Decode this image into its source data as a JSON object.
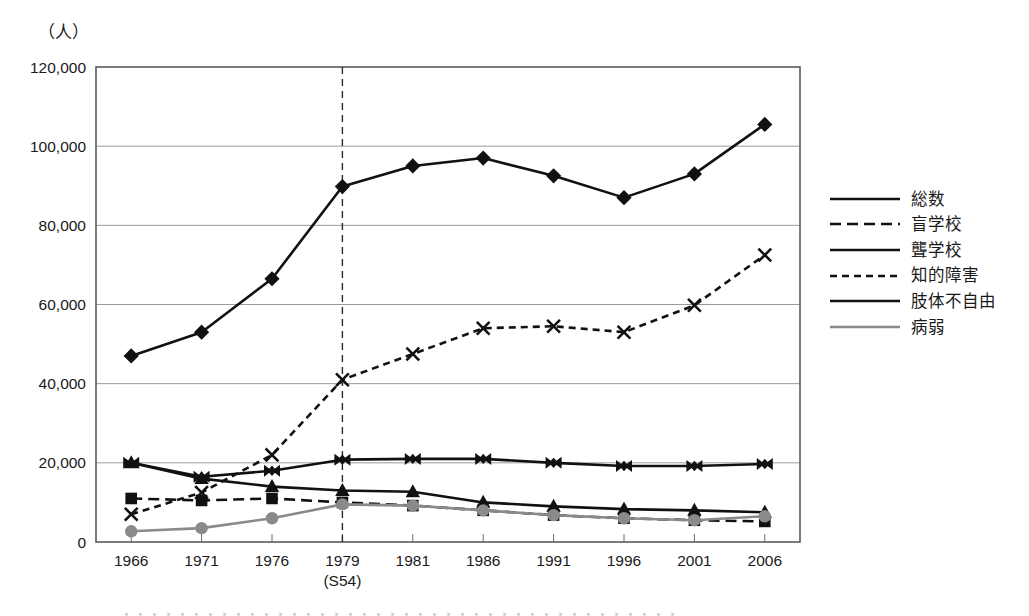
{
  "axis": {
    "unit_label": "（人）",
    "y_ticks": [
      "0",
      "20,000",
      "40,000",
      "60,000",
      "80,000",
      "100,000",
      "120,000"
    ],
    "x_sub_label": "(S54)"
  },
  "legend": {
    "items": [
      {
        "label": "総数",
        "marker": "diamond-marker",
        "line": "solid",
        "color": "#111111"
      },
      {
        "label": "盲学校",
        "marker": "square-marker",
        "line": "dashed",
        "color": "#111111"
      },
      {
        "label": "聾学校",
        "marker": "triangle-marker",
        "line": "solid",
        "color": "#111111"
      },
      {
        "label": "知的障害",
        "marker": "cross-marker",
        "line": "dotted",
        "color": "#111111"
      },
      {
        "label": "肢体不自由",
        "marker": "bowtie-marker",
        "line": "solid",
        "color": "#111111"
      },
      {
        "label": "病弱",
        "marker": "circle-marker",
        "line": "solid",
        "color": "#8a8a8a"
      }
    ]
  },
  "caption": "・・・・・・・・・・・・・・・・・・・・・・・・・・・・・・・・・・・・・・・・",
  "chart_data": {
    "type": "line",
    "title": "",
    "xlabel": "",
    "ylabel": "（人）",
    "ylim": [
      0,
      120000
    ],
    "ytick_step": 20000,
    "grid": true,
    "legend_position": "right",
    "categories": [
      "1966",
      "1971",
      "1976",
      "1979",
      "1981",
      "1986",
      "1991",
      "1996",
      "2001",
      "2006"
    ],
    "reference_line": {
      "category": "1979",
      "style": "dashed",
      "annotation": "(S54)"
    },
    "series": [
      {
        "name": "総数",
        "marker": "diamond",
        "line": "solid",
        "color": "#111111",
        "values": [
          47000,
          53000,
          66500,
          89800,
          95000,
          97000,
          92500,
          87000,
          93000,
          105500
        ]
      },
      {
        "name": "盲学校",
        "marker": "square",
        "line": "dashed",
        "color": "#111111",
        "values": [
          11000,
          10500,
          11000,
          10000,
          9200,
          8000,
          6800,
          6000,
          5500,
          5200
        ]
      },
      {
        "name": "聾学校",
        "marker": "triangle",
        "line": "solid",
        "color": "#111111",
        "values": [
          20000,
          16000,
          14000,
          13000,
          12700,
          10000,
          9000,
          8300,
          8000,
          7500
        ]
      },
      {
        "name": "知的障害",
        "marker": "cross",
        "line": "dotted",
        "color": "#111111",
        "values": [
          7000,
          12500,
          22000,
          41000,
          47500,
          54000,
          54500,
          53000,
          59800,
          72500
        ]
      },
      {
        "name": "肢体不自由",
        "marker": "bowtie",
        "line": "solid",
        "color": "#111111",
        "values": [
          20000,
          16500,
          18000,
          20800,
          21000,
          21000,
          20000,
          19200,
          19200,
          19700
        ]
      },
      {
        "name": "病弱",
        "marker": "circle",
        "line": "solid",
        "color": "#8a8a8a",
        "values": [
          2700,
          3500,
          6000,
          9500,
          9200,
          8000,
          6800,
          6000,
          5500,
          6500
        ]
      }
    ]
  }
}
